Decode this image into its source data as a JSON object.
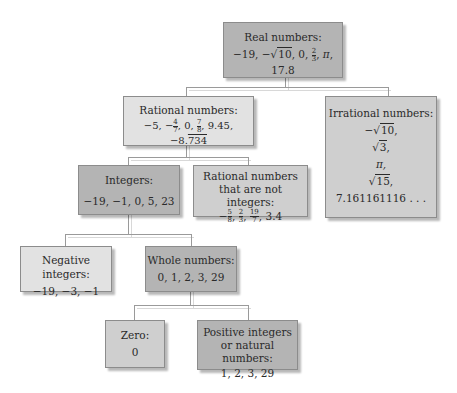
{
  "nodes": {
    "real": {
      "title": "Real numbers:",
      "values": "−19, −√10, 0, 2/3, π, 17.8"
    },
    "rational": {
      "title": "Rational numbers:",
      "values": "−5, −4/7, 0, 7/8, 9.45, −8.734 (repeating 734)"
    },
    "irrational": {
      "title": "Irrational numbers:",
      "values": [
        "−√10,",
        "√3,",
        "π,",
        "√15,",
        "7.161161116 . . ."
      ]
    },
    "integers": {
      "title": "Integers:",
      "values": "−19, −1, 0, 5, 23"
    },
    "rational_non_integers": {
      "title_line1": "Rational numbers",
      "title_line2": "that are not integers:",
      "values": "−5/8, 2/3, 19/7, 3.4"
    },
    "negative_integers": {
      "title": "Negative integers:",
      "values": "−19, −3, −1"
    },
    "whole": {
      "title": "Whole numbers:",
      "values": "0, 1, 2, 3, 29"
    },
    "zero": {
      "title": "Zero:",
      "values": "0"
    },
    "positive": {
      "title_line1": "Positive integers",
      "title_line2": "or natural numbers:",
      "values": "1, 2, 3, 29"
    }
  },
  "edges": [
    [
      "real",
      "rational"
    ],
    [
      "real",
      "irrational"
    ],
    [
      "rational",
      "integers"
    ],
    [
      "rational",
      "rational_non_integers"
    ],
    [
      "integers",
      "negative_integers"
    ],
    [
      "integers",
      "whole"
    ],
    [
      "whole",
      "zero"
    ],
    [
      "whole",
      "positive"
    ]
  ],
  "colors": {
    "light": "#e2e2e2",
    "mid": "#cfcfcf",
    "dark": "#b4b4b4",
    "connector": "#9a9a9a"
  }
}
